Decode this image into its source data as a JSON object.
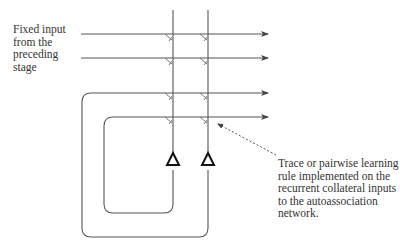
{
  "labels": {
    "input_label": "Fixed input\nfrom the\npreceding\nstage",
    "annotation_label": "Trace or pairwise learning\nrule implemented on the\nrecurrent collateral inputs\nto the autoassociation\nnetwork."
  },
  "diagram": {
    "line_color": "#444444",
    "horizontal_inputs": [
      {
        "name": "fixed-input-1",
        "y": 34
      },
      {
        "name": "fixed-input-2",
        "y": 58
      },
      {
        "name": "recurrent-collateral-outer",
        "y": 93
      },
      {
        "name": "recurrent-collateral-inner",
        "y": 117
      }
    ],
    "neurons": [
      {
        "name": "neuron-1",
        "x": 173
      },
      {
        "name": "neuron-2",
        "x": 208
      }
    ],
    "synapse_symbol": "modifiable-synapse-tick",
    "cell_body_symbol": "triangle",
    "annotation_arrow": "dashed"
  }
}
